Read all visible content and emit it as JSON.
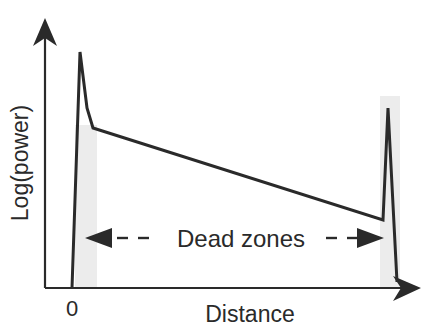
{
  "diagram": {
    "type": "otdr-trace",
    "y_axis_label": "Log(power)",
    "x_axis_label": "Distance",
    "x_origin_label": "0",
    "annotation": "Dead zones",
    "colors": {
      "line": "#2a2a2a",
      "shading": "#ececec",
      "background": "#ffffff"
    }
  }
}
